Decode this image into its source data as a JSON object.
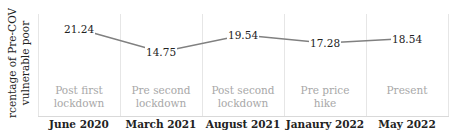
{
  "chart_data": {
    "type": "line",
    "title": "",
    "xlabel": "",
    "ylabel": "Percentage of Pre-COVID vulnerable poor",
    "ylabel_lines": [
      "Percentage of Pre-COVID",
      "vulnerable poor"
    ],
    "categories": [
      "June 2020",
      "March 2021",
      "August 2021",
      "Janaury 2022",
      "May 2022"
    ],
    "phases": [
      {
        "lines": [
          "Post first",
          "lockdown"
        ]
      },
      {
        "lines": [
          "Pre second",
          "lockdown"
        ]
      },
      {
        "lines": [
          "Post second",
          "lockdown"
        ]
      },
      {
        "lines": [
          "Pre price",
          "hike"
        ]
      },
      {
        "lines": [
          "Present"
        ]
      }
    ],
    "series": [
      {
        "name": "Percentage of Pre-COVID vulnerable poor",
        "values": [
          21.24,
          14.75,
          19.54,
          17.28,
          18.54
        ],
        "color": "#808080"
      }
    ],
    "value_labels": [
      "21.24",
      "14.75",
      "19.54",
      "17.28",
      "18.54"
    ],
    "grid": {
      "vertical_separators": true,
      "horizontal": false
    },
    "legend": "none",
    "colors": {
      "line": "#808080",
      "separator": "#e6e6e6",
      "phase_text": "#a8a8a8",
      "tick_text": "#222222"
    }
  }
}
